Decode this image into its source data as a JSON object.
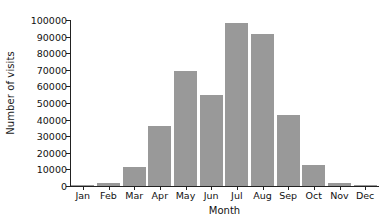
{
  "chart_data": {
    "type": "bar",
    "title": "",
    "xlabel": "Month",
    "ylabel": "Number of visits",
    "categories": [
      "Jan",
      "Feb",
      "Mar",
      "Apr",
      "May",
      "Jun",
      "Jul",
      "Aug",
      "Sep",
      "Oct",
      "Nov",
      "Dec"
    ],
    "values": [
      700,
      1800,
      11500,
      36000,
      69000,
      55000,
      98500,
      91500,
      43000,
      12500,
      2000,
      800
    ],
    "series": [
      {
        "name": "Number of visits",
        "values": [
          700,
          1800,
          11500,
          36000,
          69000,
          55000,
          98500,
          91500,
          43000,
          12500,
          2000,
          800
        ]
      }
    ],
    "ylim": [
      0,
      100000
    ],
    "yticks": [
      0,
      10000,
      20000,
      30000,
      40000,
      50000,
      60000,
      70000,
      80000,
      90000,
      100000
    ],
    "ytick_labels": [
      "0",
      "10000",
      "20000",
      "30000",
      "40000",
      "50000",
      "60000",
      "70000",
      "80000",
      "90000",
      "100000"
    ],
    "grid": false,
    "legend": false,
    "bar_color": "#999999",
    "axis_color": "#222222",
    "background": "#ffffff"
  }
}
